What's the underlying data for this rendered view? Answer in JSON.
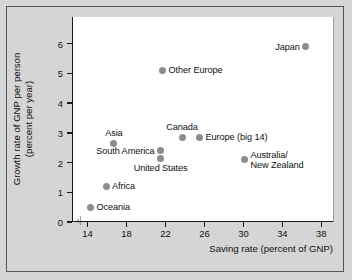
{
  "chart_data": {
    "type": "scatter",
    "title": "",
    "xlabel": "Saving rate (percent of GNP)",
    "ylabel_line1": "Growth rate of GNP per person",
    "ylabel_line2": "(percent per year)",
    "xlim": [
      12.4,
      39.2
    ],
    "ylim": [
      0,
      6.9
    ],
    "xticks": [
      14,
      18,
      22,
      26,
      30,
      34,
      38
    ],
    "xticklabels": [
      "14",
      "18",
      "22",
      "26",
      "30",
      "34",
      "38"
    ],
    "yticks": [
      0,
      1,
      2,
      3,
      4,
      5,
      6
    ],
    "yticklabels": [
      "0",
      "1",
      "2",
      "3",
      "4",
      "5",
      "6"
    ],
    "grid": false,
    "legend": "none",
    "axis_break": "x-axis near origin",
    "marker_color": "#8d8d8d",
    "points": [
      {
        "label": "Japan",
        "x": 36.4,
        "y": 5.9,
        "label_pos": "left"
      },
      {
        "label": "Other Europe",
        "x": 21.7,
        "y": 5.1,
        "label_pos": "right"
      },
      {
        "label": "Europe (big 14)",
        "x": 25.5,
        "y": 2.85,
        "label_pos": "right"
      },
      {
        "label": "Canada",
        "x": 23.7,
        "y": 2.85,
        "label_pos": "above"
      },
      {
        "label": "Asia",
        "x": 16.7,
        "y": 2.65,
        "label_pos": "above"
      },
      {
        "label": "South America",
        "x": 21.5,
        "y": 2.4,
        "label_pos": "left"
      },
      {
        "label": "United States",
        "x": 21.5,
        "y": 2.15,
        "label_pos": "below"
      },
      {
        "label": "Australia/\nNew Zealand",
        "x": 30.1,
        "y": 2.1,
        "label_pos": "right"
      },
      {
        "label": "Africa",
        "x": 15.9,
        "y": 1.2,
        "label_pos": "right"
      },
      {
        "label": "Oceania",
        "x": 14.3,
        "y": 0.5,
        "label_pos": "right"
      }
    ]
  },
  "axis_break_glyph": "("
}
